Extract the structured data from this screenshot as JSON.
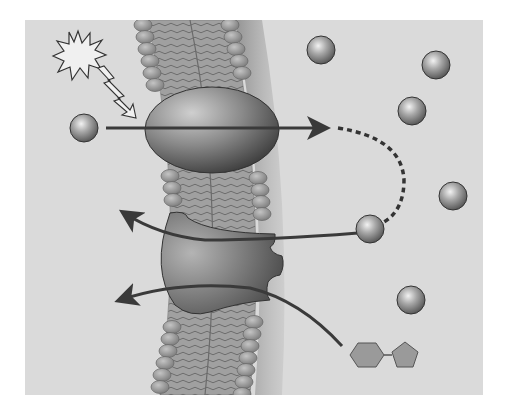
{
  "diagram": {
    "type": "membrane-transport",
    "colors": {
      "background": "#ffffff",
      "panel": "#dadada",
      "membrane_head": "#9a9a9a",
      "membrane_tail": "#8c8c8c",
      "protein": "#6e6e6e",
      "arrow": "#3a3a3a",
      "ligand": "#9a9a9a"
    },
    "elements": {
      "stimulus": "light-starburst",
      "lightning": "light-signal",
      "channel_protein": "ellipsoid-channel",
      "receptor_protein": "ligand-gated-receptor",
      "ligand": "hexagon-pentagon-molecule"
    },
    "ions": [
      {
        "id": "ion-left",
        "cx": 84,
        "cy": 128
      },
      {
        "id": "ion-1",
        "cx": 321,
        "cy": 50
      },
      {
        "id": "ion-2",
        "cx": 436,
        "cy": 65
      },
      {
        "id": "ion-3",
        "cx": 412,
        "cy": 111
      },
      {
        "id": "ion-4",
        "cx": 453,
        "cy": 196
      },
      {
        "id": "ion-5",
        "cx": 370,
        "cy": 229
      },
      {
        "id": "ion-6",
        "cx": 411,
        "cy": 300
      }
    ]
  }
}
